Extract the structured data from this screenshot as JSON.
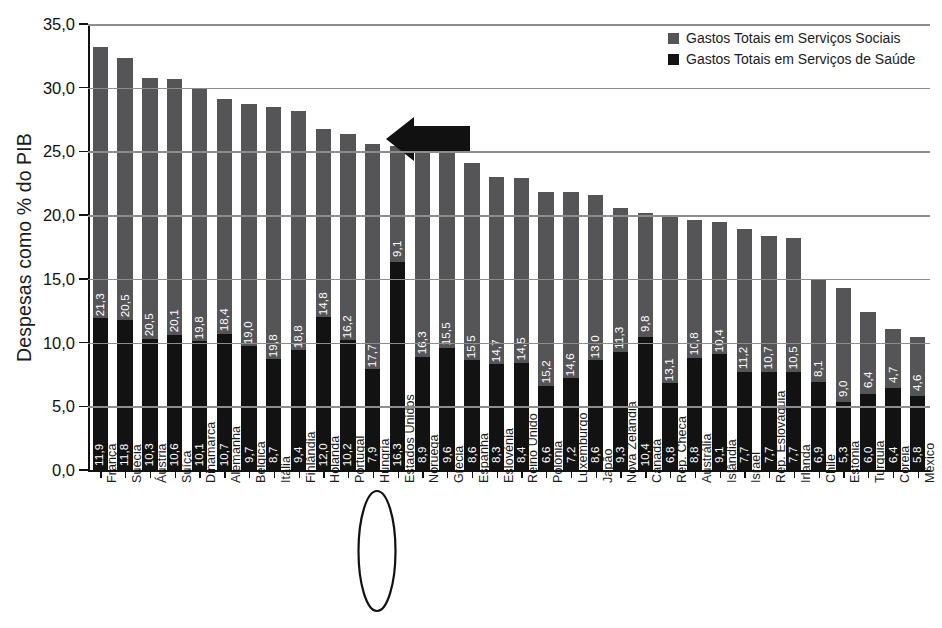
{
  "chart_data": {
    "type": "bar",
    "subtype": "stacked-bar",
    "title": "",
    "xlabel": "",
    "ylabel": "Despesas como % do PIB",
    "ylim": [
      0,
      35
    ],
    "ytick_labels": [
      "0,0",
      "5,0",
      "10,0",
      "15,0",
      "20,0",
      "25,0",
      "30,0",
      "35,0"
    ],
    "ytick_values": [
      0,
      5,
      10,
      15,
      20,
      25,
      30,
      35
    ],
    "grid": true,
    "grid_axis": "y",
    "legend_position": "top-right",
    "decimal_separator": ",",
    "categories": [
      "França",
      "Suécia",
      "Áustria",
      "Suíça",
      "Dinamarca",
      "Alemanha",
      "Bélgica",
      "Itália",
      "Finlândia",
      "Holanda",
      "Portugal",
      "Hungria",
      "Estados Unidos",
      "Noruega",
      "Grécia",
      "Espanha",
      "Eslovénia",
      "Reino Unido",
      "Polónia",
      "Luxemburgo",
      "Japão",
      "Nova Zelândia",
      "Canadá",
      "Rep. Checa",
      "Austrália",
      "Islândia",
      "Israel",
      "Rep. Eslováquia",
      "Irlanda",
      "Chile",
      "Estónia",
      "Turquia",
      "Coreia",
      "México"
    ],
    "series": [
      {
        "name": "Gastos Totais em Serviços de Saúde",
        "color": "#121212",
        "values": [
          11.9,
          11.8,
          10.3,
          10.6,
          10.1,
          10.7,
          9.7,
          8.7,
          9.4,
          12.0,
          10.2,
          7.9,
          16.3,
          8.9,
          9.6,
          8.6,
          8.3,
          8.4,
          6.6,
          7.2,
          8.6,
          9.3,
          10.4,
          6.8,
          8.8,
          9.1,
          7.7,
          7.7,
          7.7,
          6.9,
          5.3,
          6.0,
          6.4,
          5.8
        ]
      },
      {
        "name": "Gastos Totais em Serviços Sociais",
        "color": "#555558",
        "values": [
          21.3,
          20.5,
          20.5,
          20.1,
          19.8,
          18.4,
          19.0,
          19.8,
          18.8,
          14.8,
          16.2,
          17.7,
          9.1,
          16.3,
          15.5,
          15.5,
          14.7,
          14.5,
          15.2,
          14.6,
          13.0,
          11.3,
          9.8,
          13.1,
          10.8,
          10.4,
          11.2,
          10.7,
          10.5,
          8.1,
          9.0,
          6.4,
          4.7,
          4.6
        ]
      }
    ],
    "totals": [
      33.2,
      32.3,
      30.8,
      30.7,
      29.9,
      29.1,
      28.7,
      28.5,
      28.2,
      26.8,
      26.4,
      25.6,
      25.4,
      25.2,
      25.1,
      24.1,
      23.0,
      22.9,
      21.8,
      21.8,
      21.6,
      20.6,
      20.2,
      19.9,
      19.6,
      19.5,
      18.9,
      18.4,
      18.2,
      15.0,
      14.3,
      12.4,
      11.1,
      10.4
    ],
    "annotations": [
      {
        "kind": "arrow",
        "direction": "left",
        "points_at": "Estados Unidos",
        "color": "#111111"
      },
      {
        "kind": "ellipse",
        "encircles": "Estados Unidos",
        "color": "#111111"
      }
    ]
  },
  "legend": {
    "items": [
      {
        "label": "Gastos Totais em Serviços Sociais",
        "color": "#555558"
      },
      {
        "label": "Gastos Totais em Serviços de Saúde",
        "color": "#121212"
      }
    ]
  }
}
